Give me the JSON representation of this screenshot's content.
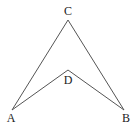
{
  "diagram": {
    "type": "geometry-figure",
    "points": {
      "A": {
        "label": "A",
        "x": 12,
        "y": 110,
        "label_x": 11,
        "label_y": 122
      },
      "B": {
        "label": "B",
        "x": 124,
        "y": 110,
        "label_x": 126,
        "label_y": 122
      },
      "C": {
        "label": "C",
        "x": 68,
        "y": 20,
        "label_x": 68,
        "label_y": 15
      },
      "D": {
        "label": "D",
        "x": 68,
        "y": 70,
        "label_x": 68,
        "label_y": 84
      }
    },
    "edges": [
      {
        "from": "A",
        "to": "C"
      },
      {
        "from": "C",
        "to": "B"
      },
      {
        "from": "A",
        "to": "D"
      },
      {
        "from": "D",
        "to": "B"
      }
    ],
    "colors": {
      "line": "#555555",
      "text": "#222222",
      "background": "#ffffff"
    }
  }
}
